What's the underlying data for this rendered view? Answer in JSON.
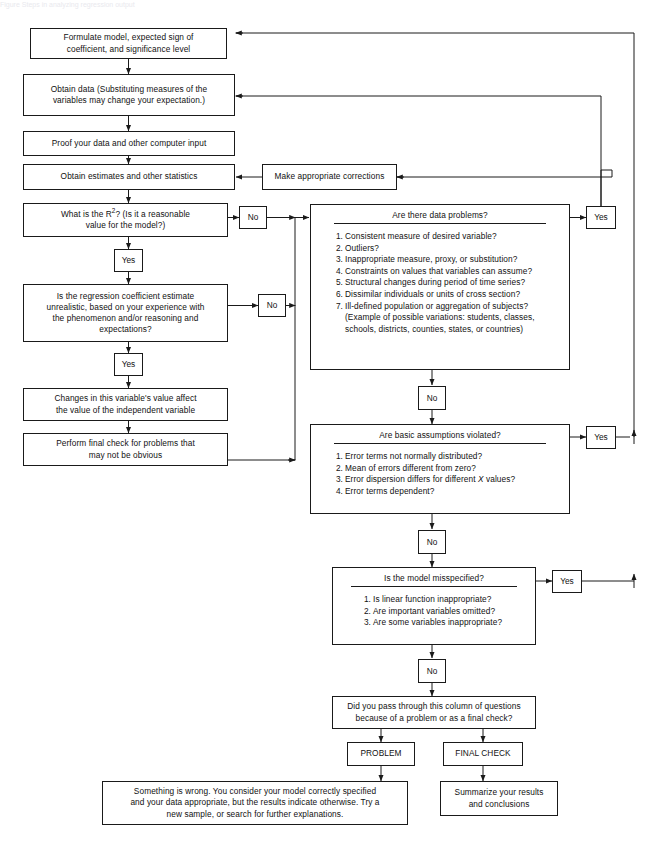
{
  "page": {
    "header_faint": "Figure  Steps in analyzing regression output"
  },
  "flow": {
    "formulate": "Formulate model, expected sign of coefficient, and significance level",
    "formulate_l1": "Formulate model, expected sign of",
    "formulate_l2": "coefficient, and significance level",
    "obtain_data_l1": "Obtain data (Substituting measures of the",
    "obtain_data_l2": "variables may change your expectation.)",
    "proof_data": "Proof your data and other computer input",
    "obtain_estimates": "Obtain estimates and other statistics",
    "corrections": "Make appropriate corrections",
    "r2_l1": "What is the R",
    "r2_sup": "2",
    "r2_l1b": "? (Is it a reasonable",
    "r2_l2": "value for the model?)",
    "regression_l1": "Is the regression coefficient estimate",
    "regression_l2": "unrealistic, based on your experience with",
    "regression_l3": "the phenomenon and/or reasoning and",
    "regression_l4": "expectations?",
    "changes_l1": "Changes in this variable's value affect",
    "changes_l2": "the value of the independent variable",
    "final_check_l1": "Perform final check for problems that",
    "final_check_l2": "may not be obvious",
    "column_question_l1": "Did you pass through this column of questions",
    "column_question_l2": "because of a problem or as a final check?",
    "problem": "PROBLEM",
    "final_check_tag": "FINAL CHECK",
    "something_wrong_l1": "Something is wrong.  You consider your model correctly specified",
    "something_wrong_l2": "and your data appropriate, but the results indicate otherwise.  Try a",
    "something_wrong_l3": "new sample, or search for further explanations.",
    "summarize_l1": "Summarize your results",
    "summarize_l2": "and conclusions"
  },
  "questions": {
    "data_problems": {
      "title": "Are there data problems?",
      "items": [
        "Consistent measure of desired variable?",
        "Outliers?",
        "Inappropriate measure, proxy, or substitution?",
        "Constraints on values that variables can assume?",
        "Structural changes during period of time series?",
        "Dissimilar individuals or units of cross section?",
        "Ill-defined population or aggregation of subjects?"
      ],
      "note_l1": "(Example of possible variations: students, classes,",
      "note_l2": "schools, districts, counties, states, or countries)"
    },
    "assumptions": {
      "title": "Are basic assumptions violated?",
      "items": [
        "Error terms not normally distributed?",
        "Mean of errors different from zero?",
        "Error dispersion differs for different X values?",
        "Error terms dependent?"
      ],
      "item3_pre": "Error dispersion differs for different ",
      "item3_var": "X",
      "item3_post": " values?"
    },
    "misspecified": {
      "title": "Is the model misspecified?",
      "items": [
        "Is linear function inappropriate?",
        "Are important variables omitted?",
        "Are some variables inappropriate?"
      ]
    }
  },
  "labels": {
    "yes": "Yes",
    "no": "No"
  },
  "colors": {
    "stroke": "#1a1a1a",
    "fill": "#ffffff",
    "text": "#111111"
  }
}
